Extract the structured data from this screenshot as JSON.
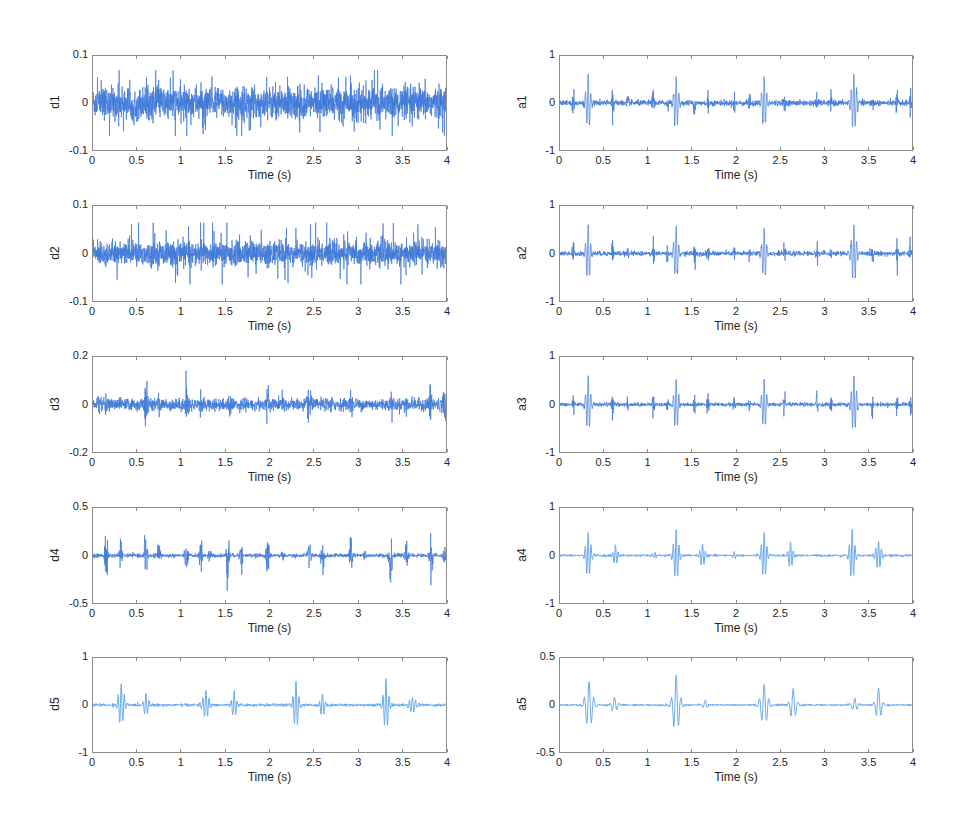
{
  "figure": {
    "layout": {
      "columns": 2,
      "rows": 5
    },
    "line_color_dark": "#3f78d8",
    "line_color_light": "#6aaaf0",
    "frame_color": "#8c8c8c"
  },
  "chart_data": [
    {
      "id": "d1",
      "type": "line",
      "ylabel": "d1",
      "xlabel": "Time (s)",
      "xlim": [
        0,
        4
      ],
      "ylim": [
        -0.1,
        0.1
      ],
      "xticks": [
        "0",
        "0.5",
        "1",
        "1.5",
        "2",
        "2.5",
        "3",
        "3.5",
        "4"
      ],
      "yticks": [
        "0.1",
        "0",
        "-0.1"
      ],
      "signal": {
        "kind": "noise",
        "amplitude": 0.03,
        "peak": 0.07
      },
      "box": {
        "left": 92,
        "top": 55,
        "right": 447,
        "bottom": 151
      }
    },
    {
      "id": "d2",
      "type": "line",
      "ylabel": "d2",
      "xlabel": "Time (s)",
      "xlim": [
        0,
        4
      ],
      "ylim": [
        -0.1,
        0.1
      ],
      "xticks": [
        "0",
        "0.5",
        "1",
        "1.5",
        "2",
        "2.5",
        "3",
        "3.5",
        "4"
      ],
      "yticks": [
        "0.1",
        "0",
        "-0.1"
      ],
      "signal": {
        "kind": "noise",
        "amplitude": 0.022,
        "peak": 0.065
      },
      "box": {
        "left": 92,
        "top": 205,
        "right": 447,
        "bottom": 302
      }
    },
    {
      "id": "d3",
      "type": "line",
      "ylabel": "d3",
      "xlabel": "Time (s)",
      "xlim": [
        0,
        4
      ],
      "ylim": [
        -0.2,
        0.2
      ],
      "xticks": [
        "0",
        "0.5",
        "1",
        "1.5",
        "2",
        "2.5",
        "3",
        "3.5",
        "4"
      ],
      "yticks": [
        "0.2",
        "0",
        "-0.2"
      ],
      "signal": {
        "kind": "bursts",
        "base_noise": 0.025,
        "width": 0.02,
        "events": [
          [
            0.06,
            0.05
          ],
          [
            0.14,
            0.04
          ],
          [
            0.3,
            0.04
          ],
          [
            0.6,
            0.12
          ],
          [
            0.75,
            0.05
          ],
          [
            1.06,
            0.12
          ],
          [
            1.22,
            0.05
          ],
          [
            1.55,
            0.05
          ],
          [
            1.72,
            0.04
          ],
          [
            1.98,
            0.1
          ],
          [
            2.15,
            0.05
          ],
          [
            2.45,
            0.14
          ],
          [
            2.7,
            0.05
          ],
          [
            2.93,
            0.07
          ],
          [
            3.38,
            0.07
          ],
          [
            3.55,
            0.06
          ],
          [
            3.82,
            0.12
          ],
          [
            3.98,
            0.1
          ]
        ]
      },
      "box": {
        "left": 92,
        "top": 356,
        "right": 447,
        "bottom": 453
      }
    },
    {
      "id": "d4",
      "type": "line",
      "ylabel": "d4",
      "xlabel": "Time (s)",
      "xlim": [
        0,
        4
      ],
      "ylim": [
        -0.5,
        0.5
      ],
      "xticks": [
        "0",
        "0.5",
        "1",
        "1.5",
        "2",
        "2.5",
        "3",
        "3.5",
        "4"
      ],
      "yticks": [
        "0.5",
        "0",
        "-0.5"
      ],
      "signal": {
        "kind": "bursts",
        "base_noise": 0.02,
        "width": 0.018,
        "events": [
          [
            0.15,
            0.4
          ],
          [
            0.31,
            0.18
          ],
          [
            0.6,
            0.35
          ],
          [
            0.75,
            0.15
          ],
          [
            1.06,
            0.25
          ],
          [
            1.22,
            0.22
          ],
          [
            1.32,
            0.1
          ],
          [
            1.53,
            0.35
          ],
          [
            1.68,
            0.25
          ],
          [
            1.98,
            0.3
          ],
          [
            2.15,
            0.08
          ],
          [
            2.45,
            0.3
          ],
          [
            2.6,
            0.2
          ],
          [
            2.92,
            0.32
          ],
          [
            3.08,
            0.15
          ],
          [
            3.37,
            0.45
          ],
          [
            3.55,
            0.15
          ],
          [
            3.83,
            0.3
          ],
          [
            3.98,
            0.15
          ]
        ]
      },
      "box": {
        "left": 92,
        "top": 507,
        "right": 447,
        "bottom": 604
      }
    },
    {
      "id": "d5",
      "type": "line",
      "ylabel": "d5",
      "xlabel": "Time (s)",
      "xlim": [
        0,
        4
      ],
      "ylim": [
        -1,
        1
      ],
      "xticks": [
        "0",
        "0.5",
        "1",
        "1.5",
        "2",
        "2.5",
        "3",
        "3.5",
        "4"
      ],
      "yticks": [
        "1",
        "0",
        "-1"
      ],
      "signal": {
        "kind": "wavelets",
        "base_noise": 0.015,
        "freq": 28,
        "events": [
          [
            0.32,
            0.45,
            0.04
          ],
          [
            0.6,
            0.25,
            0.03
          ],
          [
            1.28,
            0.3,
            0.04
          ],
          [
            1.6,
            0.3,
            0.03
          ],
          [
            2.3,
            0.5,
            0.035
          ],
          [
            2.6,
            0.25,
            0.03
          ],
          [
            3.32,
            0.55,
            0.035
          ],
          [
            3.62,
            0.15,
            0.05
          ]
        ]
      },
      "box": {
        "left": 92,
        "top": 657,
        "right": 447,
        "bottom": 753
      }
    },
    {
      "id": "a1",
      "type": "line",
      "ylabel": "a1",
      "xlabel": "Time (s)",
      "xlim": [
        0,
        4
      ],
      "ylim": [
        -1,
        1
      ],
      "xticks": [
        "0",
        "0.5",
        "1",
        "1.5",
        "2",
        "2.5",
        "3",
        "3.5",
        "4"
      ],
      "yticks": [
        "1",
        "0",
        "-1"
      ],
      "signal": {
        "kind": "mixed",
        "base_noise": 0.03,
        "spikes": [
          [
            0.15,
            0.35
          ],
          [
            0.6,
            0.45
          ],
          [
            0.77,
            0.2
          ],
          [
            1.06,
            0.35
          ],
          [
            1.22,
            0.2
          ],
          [
            1.53,
            0.35
          ],
          [
            1.68,
            0.3
          ],
          [
            1.98,
            0.3
          ],
          [
            2.15,
            0.25
          ],
          [
            2.55,
            0.25
          ],
          [
            2.92,
            0.3
          ],
          [
            3.08,
            0.2
          ],
          [
            3.55,
            0.25
          ],
          [
            3.83,
            0.35
          ],
          [
            3.98,
            0.3
          ]
        ],
        "wavelets": [
          [
            0.32,
            0.6,
            0.03
          ],
          [
            1.32,
            0.55,
            0.03
          ],
          [
            2.32,
            0.55,
            0.03
          ],
          [
            3.34,
            0.6,
            0.035
          ]
        ]
      },
      "box": {
        "left": 559,
        "top": 55,
        "right": 913,
        "bottom": 151
      }
    },
    {
      "id": "a2",
      "type": "line",
      "ylabel": "a2",
      "xlabel": "Time (s)",
      "xlim": [
        0,
        4
      ],
      "ylim": [
        -1,
        1
      ],
      "xticks": [
        "0",
        "0.5",
        "1",
        "1.5",
        "2",
        "2.5",
        "3",
        "3.5",
        "4"
      ],
      "yticks": [
        "1",
        "0",
        "-1"
      ],
      "signal": {
        "kind": "mixed",
        "base_noise": 0.025,
        "spikes": [
          [
            0.15,
            0.35
          ],
          [
            0.6,
            0.45
          ],
          [
            0.77,
            0.2
          ],
          [
            1.06,
            0.3
          ],
          [
            1.22,
            0.2
          ],
          [
            1.53,
            0.35
          ],
          [
            1.68,
            0.3
          ],
          [
            1.98,
            0.28
          ],
          [
            2.15,
            0.22
          ],
          [
            2.55,
            0.25
          ],
          [
            2.92,
            0.3
          ],
          [
            3.08,
            0.2
          ],
          [
            3.55,
            0.25
          ],
          [
            3.83,
            0.35
          ],
          [
            3.98,
            0.3
          ]
        ],
        "wavelets": [
          [
            0.32,
            0.6,
            0.03
          ],
          [
            1.32,
            0.55,
            0.03
          ],
          [
            2.32,
            0.55,
            0.03
          ],
          [
            3.34,
            0.6,
            0.035
          ]
        ]
      },
      "box": {
        "left": 559,
        "top": 205,
        "right": 913,
        "bottom": 302
      }
    },
    {
      "id": "a3",
      "type": "line",
      "ylabel": "a3",
      "xlabel": "Time (s)",
      "xlim": [
        0,
        4
      ],
      "ylim": [
        -1,
        1
      ],
      "xticks": [
        "0",
        "0.5",
        "1",
        "1.5",
        "2",
        "2.5",
        "3",
        "3.5",
        "4"
      ],
      "yticks": [
        "1",
        "0",
        "-1"
      ],
      "signal": {
        "kind": "mixed",
        "base_noise": 0.02,
        "spikes": [
          [
            0.15,
            0.35
          ],
          [
            0.6,
            0.35
          ],
          [
            0.77,
            0.2
          ],
          [
            1.06,
            0.3
          ],
          [
            1.22,
            0.2
          ],
          [
            1.53,
            0.35
          ],
          [
            1.68,
            0.3
          ],
          [
            1.98,
            0.28
          ],
          [
            2.15,
            0.22
          ],
          [
            2.55,
            0.3
          ],
          [
            2.92,
            0.35
          ],
          [
            3.08,
            0.2
          ],
          [
            3.55,
            0.25
          ],
          [
            3.83,
            0.35
          ],
          [
            3.98,
            0.3
          ]
        ],
        "wavelets": [
          [
            0.32,
            0.6,
            0.03
          ],
          [
            1.32,
            0.55,
            0.03
          ],
          [
            2.32,
            0.55,
            0.03
          ],
          [
            3.34,
            0.6,
            0.035
          ]
        ]
      },
      "box": {
        "left": 559,
        "top": 356,
        "right": 913,
        "bottom": 453
      }
    },
    {
      "id": "a4",
      "type": "line",
      "ylabel": "a4",
      "xlabel": "Time (s)",
      "xlim": [
        0,
        4
      ],
      "ylim": [
        -1,
        1
      ],
      "xticks": [
        "0",
        "0.5",
        "1",
        "1.5",
        "2",
        "2.5",
        "3",
        "3.5",
        "4"
      ],
      "yticks": [
        "1",
        "0",
        "-1"
      ],
      "signal": {
        "kind": "wavelets",
        "base_noise": 0.012,
        "freq": 30,
        "events": [
          [
            0.32,
            0.5,
            0.035
          ],
          [
            0.63,
            0.22,
            0.03
          ],
          [
            1.08,
            0.06,
            0.03
          ],
          [
            1.32,
            0.55,
            0.035
          ],
          [
            1.62,
            0.25,
            0.035
          ],
          [
            1.98,
            0.08,
            0.02
          ],
          [
            2.32,
            0.5,
            0.035
          ],
          [
            2.62,
            0.3,
            0.03
          ],
          [
            3.32,
            0.55,
            0.035
          ],
          [
            3.62,
            0.3,
            0.04
          ]
        ]
      },
      "box": {
        "left": 559,
        "top": 507,
        "right": 913,
        "bottom": 604
      }
    },
    {
      "id": "a5",
      "type": "line",
      "ylabel": "a5",
      "xlabel": "Time (s)",
      "xlim": [
        0,
        4
      ],
      "ylim": [
        -0.5,
        0.5
      ],
      "xticks": [
        "0",
        "0.5",
        "1",
        "1.5",
        "2",
        "2.5",
        "3",
        "3.5",
        "4"
      ],
      "yticks": [
        "0.5",
        "0",
        "-0.5"
      ],
      "signal": {
        "kind": "wavelets",
        "base_noise": 0.005,
        "freq": 18,
        "events": [
          [
            0.33,
            0.25,
            0.05
          ],
          [
            0.62,
            0.08,
            0.04
          ],
          [
            1.32,
            0.32,
            0.045
          ],
          [
            1.65,
            0.05,
            0.03
          ],
          [
            2.32,
            0.22,
            0.05
          ],
          [
            2.65,
            0.17,
            0.04
          ],
          [
            3.35,
            0.07,
            0.04
          ],
          [
            3.62,
            0.17,
            0.04
          ]
        ]
      },
      "box": {
        "left": 559,
        "top": 657,
        "right": 913,
        "bottom": 753
      }
    }
  ]
}
